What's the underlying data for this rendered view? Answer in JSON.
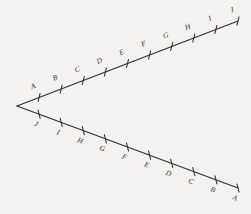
{
  "figure": {
    "background_color": "#f4f2f0",
    "ink_color": "#2f2f30",
    "vertex": {
      "x": 17,
      "y": 106,
      "label": ""
    },
    "rays": [
      {
        "id": "upper-ray",
        "name": "upper-ray",
        "start": {
          "x": 17,
          "y": 106
        },
        "end": {
          "x": 238,
          "y": 21
        },
        "label_side": "above",
        "labels": [
          "A",
          "B",
          "C",
          "D",
          "E",
          "F",
          "G",
          "H",
          "I",
          "J"
        ],
        "tick_fractions": [
          0.1,
          0.2,
          0.3,
          0.4,
          0.5,
          0.6,
          0.7,
          0.8,
          0.9,
          1.0
        ]
      },
      {
        "id": "lower-ray",
        "name": "lower-ray",
        "start": {
          "x": 17,
          "y": 106
        },
        "end": {
          "x": 238,
          "y": 188
        },
        "label_side": "below",
        "labels": [
          "J",
          "I",
          "H",
          "G",
          "F",
          "E",
          "D",
          "C",
          "B",
          "A"
        ],
        "tick_fractions": [
          0.1,
          0.2,
          0.3,
          0.4,
          0.5,
          0.6,
          0.7,
          0.8,
          0.9,
          1.0
        ]
      }
    ],
    "tick_half_length": 4.2,
    "label_offset": 7.5
  }
}
